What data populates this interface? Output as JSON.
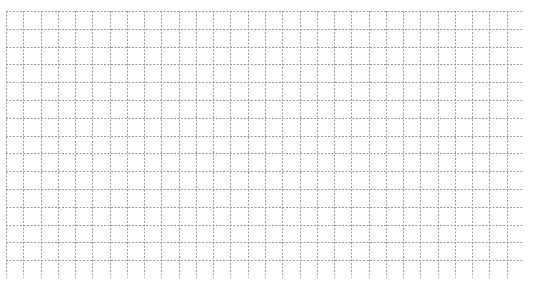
{
  "grid": {
    "columns": 30,
    "rows": 15,
    "line_color": "#9a9a9a",
    "background": "#ffffff",
    "line_style": "dashed"
  }
}
